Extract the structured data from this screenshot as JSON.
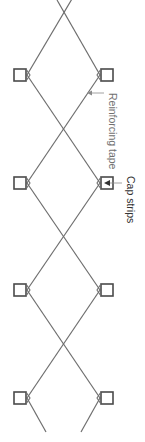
{
  "diagram": {
    "type": "lattice-reinforcement",
    "orientation": "rotated-90-clockwise",
    "labels": {
      "reinforcing_tape": "Reinforcing tape",
      "cap_strips": "Cap strips"
    },
    "colors": {
      "line": "#6e6e6e",
      "cap_outline": "#4a4a4a",
      "label_light": "#707070",
      "label_dark": "#333333",
      "background": "#ffffff"
    },
    "cap_count_per_side": 4,
    "crossing_count": 4
  }
}
